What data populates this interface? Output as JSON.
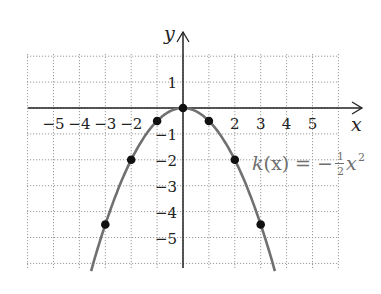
{
  "chart_data": {
    "type": "line",
    "title": "",
    "xlabel": "x",
    "ylabel": "y",
    "function_label": "k(x) = -1/2 x^2",
    "function_label_parts": {
      "name": "k",
      "arg": "(x)",
      "eq": " = −",
      "num": "1",
      "den": "2",
      "var": "x",
      "exp": "2"
    },
    "xlim": [
      -6,
      6
    ],
    "ylim": [
      -6,
      2
    ],
    "grid": true,
    "x_tick_labels": [
      "−5",
      "−4",
      "−3",
      "−2",
      "2",
      "3",
      "4",
      "5"
    ],
    "x_ticks": [
      -5,
      -4,
      -3,
      -2,
      2,
      3,
      4,
      5
    ],
    "y_tick_labels": [
      "1",
      "−1",
      "−2",
      "−3",
      "−4",
      "−5"
    ],
    "y_ticks": [
      1,
      -1,
      -2,
      -3,
      -4,
      -5
    ],
    "series": [
      {
        "name": "k(x) = -1/2 x^2",
        "color": "#707070",
        "points": [
          {
            "x": -3,
            "y": -4.5
          },
          {
            "x": -2,
            "y": -2
          },
          {
            "x": -1,
            "y": -0.5
          },
          {
            "x": 0,
            "y": 0
          },
          {
            "x": 1,
            "y": -0.5
          },
          {
            "x": 2,
            "y": -2
          },
          {
            "x": 3,
            "y": -4.5
          }
        ]
      }
    ]
  }
}
